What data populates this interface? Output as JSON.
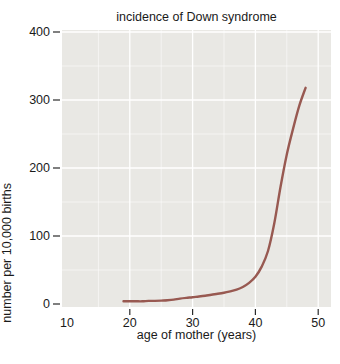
{
  "chart_data": {
    "type": "line",
    "title": "incidence of Down syndrome",
    "xlabel": "age of mother (years)",
    "ylabel": "number per 10,000 births",
    "xlim": [
      9.2,
      52
    ],
    "ylim": [
      0,
      403
    ],
    "x_tick_labels": [
      "10",
      "20",
      "30",
      "40",
      "50"
    ],
    "x_tick_values": [
      10,
      20,
      30,
      40,
      50
    ],
    "x_tick_marks": [
      20,
      30,
      40,
      50
    ],
    "y_tick_labels": [
      "0",
      "100",
      "200",
      "300",
      "400"
    ],
    "y_tick_values": [
      0,
      100,
      200,
      300,
      400
    ],
    "x_grid_major": [
      20,
      30,
      40,
      50
    ],
    "x_grid_minor": [
      15,
      25,
      35,
      45
    ],
    "y_grid_major": [
      100,
      200,
      300,
      400
    ],
    "y_grid_minor": [
      50,
      150,
      250,
      350
    ],
    "grid": "white gridlines on gray panel, minors fainter",
    "legend": "none",
    "series": [
      {
        "name": "incidence of Down syndrome",
        "points": [
          [
            19,
            4
          ],
          [
            20,
            4
          ],
          [
            21,
            4
          ],
          [
            22,
            4
          ],
          [
            23,
            4.5
          ],
          [
            24,
            4.5
          ],
          [
            25,
            5
          ],
          [
            26,
            5.5
          ],
          [
            27,
            6.5
          ],
          [
            28,
            8
          ],
          [
            29,
            9
          ],
          [
            30,
            10
          ],
          [
            31,
            11
          ],
          [
            32,
            12
          ],
          [
            33,
            13.5
          ],
          [
            34,
            15
          ],
          [
            35,
            16.5
          ],
          [
            36,
            18.5
          ],
          [
            37,
            21
          ],
          [
            38,
            25
          ],
          [
            39,
            31
          ],
          [
            40,
            40
          ],
          [
            41,
            55
          ],
          [
            42,
            78
          ],
          [
            43,
            118
          ],
          [
            44,
            172
          ],
          [
            45,
            220
          ],
          [
            46,
            258
          ],
          [
            47,
            292
          ],
          [
            48,
            318
          ]
        ]
      }
    ],
    "colors": {
      "line": "#985951",
      "plot_bg": "#e9e8e4",
      "grid": "#ffffff",
      "tick": "#2b2b2b",
      "text": "#1a1a1a",
      "page_bg": "#ffffff"
    }
  }
}
